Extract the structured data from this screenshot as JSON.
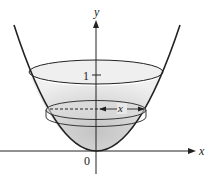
{
  "diagram": {
    "axes": {
      "x_label": "x",
      "y_label": "y",
      "origin_label": "0",
      "y_tick_label": "1"
    },
    "slice": {
      "radius_label": "x"
    },
    "colors": {
      "stroke": "#222222",
      "fill_light": "#e6e6e6",
      "fill_dark": "#bdbdbd",
      "background": "#ffffff"
    }
  }
}
